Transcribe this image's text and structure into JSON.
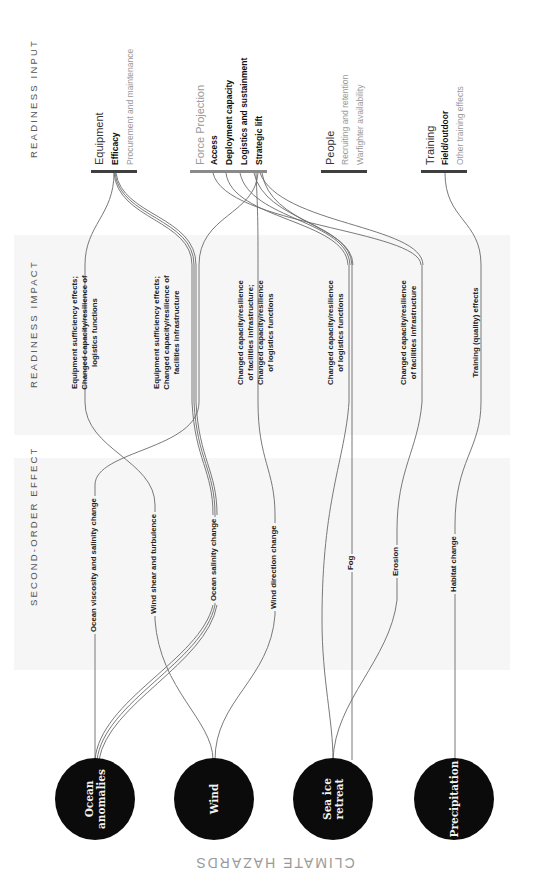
{
  "colors": {
    "bar_dark": "#3f3f3f",
    "bar_light": "#8a8a8a",
    "link": "#6a6a6a",
    "hazard_fill": "#0b0b0b",
    "band": "#f6f6f6"
  },
  "sections": {
    "readiness_input": "READINESS INPUT",
    "readiness_impact": "READINESS IMPACT",
    "second_order_effect": "SECOND-ORDER EFFECT",
    "climate_hazards": "CLIMATE HAZARDS"
  },
  "readiness_inputs": [
    {
      "title": "Equipment",
      "items": [
        {
          "label": "Efficacy",
          "active": true
        },
        {
          "label": "Procurement and maintenance",
          "active": false
        }
      ]
    },
    {
      "title": "Force Projection",
      "items": [
        {
          "label": "Access",
          "active": true
        },
        {
          "label": "Deployment capacity",
          "active": true
        },
        {
          "label": "Logistics and sustainment",
          "active": true
        },
        {
          "label": "Strategic lift",
          "active": true
        }
      ]
    },
    {
      "title": "People",
      "items": [
        {
          "label": "Recruiting and retention",
          "active": false
        },
        {
          "label": "Warfighter availability",
          "active": false
        }
      ]
    },
    {
      "title": "Training",
      "items": [
        {
          "label": "Field/outdoor",
          "active": true
        },
        {
          "label": "Other training effects",
          "active": false
        }
      ]
    }
  ],
  "readiness_impacts": [
    {
      "lines": [
        "Equipment sufficiency effects;",
        "Changed capacity/resilience of",
        "logistics functions"
      ]
    },
    {
      "lines": [
        "Equipment sufficiency effects;",
        "Changed capacity/resilience of",
        "facilities infrastructure"
      ]
    },
    {
      "lines": [
        "Changed capacity/resilience",
        "of facilities infrastructure;",
        "Changed capacity/resilience",
        "of logistics functions"
      ]
    },
    {
      "lines": [
        "Changed capacity/resilience",
        "of logistics functions"
      ]
    },
    {
      "lines": [
        "Changed capacity/resilience",
        "of facilities infrastructure"
      ]
    },
    {
      "lines": [
        "Training (quality) effects"
      ]
    }
  ],
  "second_order_effects": [
    "Ocean viscosity and salinity change",
    "Wind shear and turbulence",
    "Ocean salinity change",
    "Wind direction change",
    "Fog",
    "Erosion",
    "Habitat change"
  ],
  "climate_hazards": [
    {
      "label": "Ocean\nanomalies"
    },
    {
      "label": "Wind"
    },
    {
      "label": "Sea ice\nretreat"
    },
    {
      "label": "Precipitation"
    }
  ]
}
